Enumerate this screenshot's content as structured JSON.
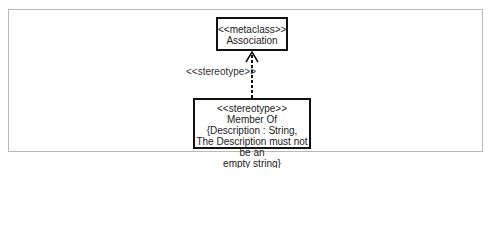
{
  "diagram": {
    "metaclass_box": {
      "stereotype": "<<metaclass>>",
      "name": "Association"
    },
    "stereotype_box": {
      "lines": [
        "<<stereotype>>",
        "Member Of",
        "{Description : String,",
        "The Description must not be an",
        "empty string}"
      ]
    },
    "connector_label": "<<stereotype>>",
    "connector": {
      "type": "dependency",
      "style": "dashed",
      "arrow": "open",
      "from": "stereotype_box",
      "to": "metaclass_box"
    }
  }
}
